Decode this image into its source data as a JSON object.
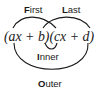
{
  "diagram": {
    "expression": "(ax + b)(cx + d)",
    "labels": {
      "first": {
        "initial": "F",
        "rest": "irst"
      },
      "last": {
        "initial": "L",
        "rest": "ast"
      },
      "inner": {
        "initial": "I",
        "rest": "nner"
      },
      "outer": {
        "initial": "O",
        "rest": "uter"
      }
    },
    "connections": [
      {
        "name": "first",
        "from": "a",
        "to": "c"
      },
      {
        "name": "last",
        "from": "b",
        "to": "d"
      },
      {
        "name": "inner",
        "from": "b",
        "to": "c"
      },
      {
        "name": "outer",
        "from": "a",
        "to": "d"
      }
    ]
  }
}
